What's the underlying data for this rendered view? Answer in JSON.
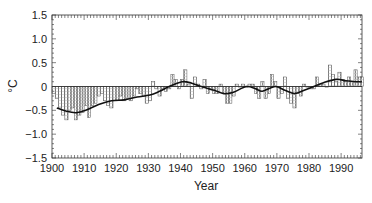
{
  "chart_data": {
    "type": "bar",
    "title": "",
    "xlabel": "Year",
    "ylabel": "°C",
    "xlim": [
      1900,
      1996.5
    ],
    "ylim": [
      -1.5,
      1.5
    ],
    "grid": false,
    "legend": null,
    "x_ticks": [
      1900,
      1910,
      1920,
      1930,
      1940,
      1950,
      1960,
      1970,
      1980,
      1990
    ],
    "x_tick_labels": [
      "1900",
      "1910",
      "1920",
      "1930",
      "1940",
      "1950",
      "1960",
      "1970",
      "1980",
      "1990"
    ],
    "y_ticks": [
      1.5,
      1.0,
      0.5,
      0,
      -0.5,
      -1.0,
      -1.5
    ],
    "y_tick_labels": [
      "1.5",
      "1.0",
      "0.5",
      "0",
      "−0.5",
      "−1.0",
      "−1.5"
    ],
    "series": [
      {
        "name": "Annual temperature anomaly",
        "type": "bar",
        "style": "hatched",
        "x": [
          1900,
          1901,
          1902,
          1903,
          1904,
          1905,
          1906,
          1907,
          1908,
          1909,
          1910,
          1911,
          1912,
          1913,
          1914,
          1915,
          1916,
          1917,
          1918,
          1919,
          1920,
          1921,
          1922,
          1923,
          1924,
          1925,
          1926,
          1927,
          1928,
          1929,
          1930,
          1931,
          1932,
          1933,
          1934,
          1935,
          1936,
          1937,
          1938,
          1939,
          1940,
          1941,
          1942,
          1943,
          1944,
          1945,
          1946,
          1947,
          1948,
          1949,
          1950,
          1951,
          1952,
          1953,
          1954,
          1955,
          1956,
          1957,
          1958,
          1959,
          1960,
          1961,
          1962,
          1963,
          1964,
          1965,
          1966,
          1967,
          1968,
          1969,
          1970,
          1971,
          1972,
          1973,
          1974,
          1975,
          1976,
          1977,
          1978,
          1979,
          1980,
          1981,
          1982,
          1983,
          1984,
          1985,
          1986,
          1987,
          1988,
          1989,
          1990,
          1991,
          1992,
          1993,
          1994,
          1995,
          1996
        ],
        "values": [
          -0.15,
          -0.25,
          -0.45,
          -0.6,
          -0.7,
          -0.5,
          -0.45,
          -0.7,
          -0.6,
          -0.55,
          -0.4,
          -0.65,
          -0.4,
          -0.35,
          -0.2,
          -0.15,
          -0.3,
          -0.4,
          -0.45,
          -0.3,
          -0.3,
          -0.2,
          -0.3,
          -0.25,
          -0.3,
          -0.2,
          -0.05,
          -0.15,
          -0.2,
          -0.35,
          -0.3,
          0.1,
          -0.05,
          -0.2,
          -0.05,
          -0.1,
          -0.05,
          0.25,
          0.15,
          -0.05,
          0.15,
          0.35,
          0.05,
          -0.25,
          0.2,
          0.05,
          -0.05,
          0.15,
          -0.15,
          -0.05,
          -0.15,
          -0.15,
          0.05,
          -0.15,
          -0.35,
          -0.35,
          -0.2,
          0.05,
          0.0,
          0.05,
          0.0,
          0.05,
          0.05,
          -0.15,
          -0.25,
          0.1,
          -0.25,
          -0.15,
          0.25,
          0.1,
          -0.25,
          -0.15,
          0.2,
          -0.25,
          -0.35,
          -0.45,
          -0.15,
          -0.2,
          0.05,
          0.0,
          -0.05,
          -0.05,
          0.2,
          0.05,
          0.05,
          0.0,
          0.45,
          0.25,
          0.1,
          0.3,
          0.15,
          0.1,
          0.2,
          0.1,
          0.35,
          0.2,
          0.2
        ]
      },
      {
        "name": "Smoothed trend",
        "type": "line",
        "x": [
          1901,
          1904,
          1907,
          1910,
          1914,
          1918,
          1922,
          1926,
          1930,
          1933,
          1936,
          1940,
          1943,
          1946,
          1950,
          1953,
          1956,
          1960,
          1963,
          1965,
          1969,
          1972,
          1975,
          1978,
          1981,
          1984,
          1988,
          1991,
          1994,
          1996
        ],
        "values": [
          -0.45,
          -0.52,
          -0.55,
          -0.5,
          -0.38,
          -0.3,
          -0.28,
          -0.22,
          -0.18,
          -0.1,
          0.0,
          0.1,
          0.07,
          0.0,
          -0.08,
          -0.15,
          -0.12,
          0.0,
          -0.05,
          -0.1,
          0.0,
          -0.08,
          -0.15,
          -0.08,
          0.0,
          0.08,
          0.15,
          0.12,
          0.1,
          0.1
        ]
      }
    ]
  }
}
